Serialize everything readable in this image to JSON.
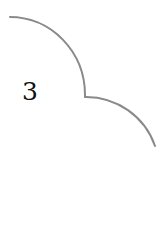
{
  "diagram": {
    "label": "3",
    "stroke_color": "#8a8a8a",
    "stroke_width": 2,
    "arcs": [
      {
        "name": "upper-arc",
        "path": "M 10 17 A 75 78 0 0 1 85 95 L 85 97"
      },
      {
        "name": "lower-arc",
        "path": "M 85 97 A 73 73 0 0 1 155 146"
      }
    ]
  }
}
